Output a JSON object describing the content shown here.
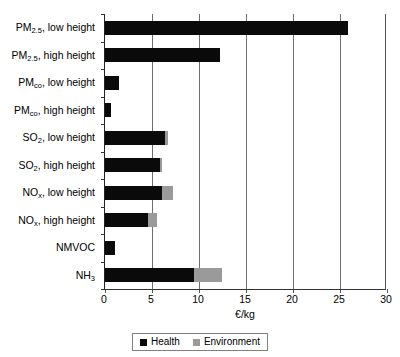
{
  "chart_data": {
    "type": "bar",
    "orientation": "horizontal",
    "stacked": true,
    "title": "",
    "xlabel": "€/kg",
    "ylabel": "",
    "xlim": [
      0,
      30
    ],
    "xticks": [
      0,
      5,
      10,
      15,
      20,
      25,
      30
    ],
    "xtick_labels": [
      "0",
      "5",
      "10",
      "15",
      "20",
      "25",
      "30"
    ],
    "grid": "vertical",
    "legend_position": "bottom-center",
    "categories": [
      "PM2.5, low height",
      "PM2.5, high height",
      "PMco, low height",
      "PMco, high height",
      "SO2, low height",
      "SO2, high height",
      "NOx, low height",
      "NOx, high height",
      "NMVOC",
      "NH3"
    ],
    "category_labels_rich": [
      {
        "base": "PM",
        "sub": "2.5",
        "rest": ", low height"
      },
      {
        "base": "PM",
        "sub": "2.5",
        "rest": ", high height"
      },
      {
        "base": "PM",
        "sub": "co",
        "rest": ", low height"
      },
      {
        "base": "PM",
        "sub": "co",
        "rest": ", high height"
      },
      {
        "base": "SO",
        "sub": "2",
        "rest": ", low height"
      },
      {
        "base": "SO",
        "sub": "2",
        "rest": ", high height"
      },
      {
        "base": "NO",
        "sub": "x",
        "rest": ", low height"
      },
      {
        "base": "NO",
        "sub": "x",
        "rest": ", high height"
      },
      {
        "base": "NMVOC",
        "sub": "",
        "rest": ""
      },
      {
        "base": "NH",
        "sub": "3",
        "rest": ""
      }
    ],
    "series": [
      {
        "name": "Health",
        "color": "#0a0a0a",
        "values": [
          25.9,
          12.2,
          1.5,
          0.6,
          6.4,
          5.9,
          6.1,
          4.6,
          1.1,
          9.5
        ]
      },
      {
        "name": "Environment",
        "color": "#9a9a9a",
        "values": [
          0.0,
          0.0,
          0.0,
          0.0,
          0.3,
          0.2,
          1.1,
          0.9,
          0.0,
          3.0
        ]
      }
    ],
    "totals": [
      25.9,
      12.2,
      1.5,
      0.6,
      6.7,
      6.1,
      7.2,
      5.5,
      1.1,
      12.5
    ]
  },
  "legend": {
    "entries": [
      {
        "label": "Health",
        "color": "#0a0a0a"
      },
      {
        "label": "Environment",
        "color": "#9a9a9a"
      }
    ]
  }
}
